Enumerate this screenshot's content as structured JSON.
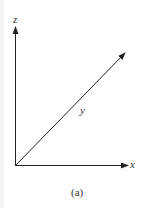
{
  "figure": {
    "axes": {
      "z_label": "z",
      "y_label": "y",
      "x_label": "x"
    },
    "caption": "(a)",
    "stroke_color": "#222222"
  }
}
